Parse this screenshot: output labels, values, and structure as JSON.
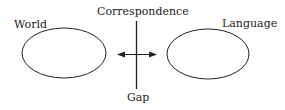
{
  "diagram": {
    "labels": {
      "world": "World",
      "correspondence": "Correspondence",
      "language": "Language",
      "gap": "Gap"
    },
    "nodes": [
      {
        "id": "world",
        "shape": "ellipse"
      },
      {
        "id": "language",
        "shape": "ellipse"
      }
    ],
    "edges": [
      {
        "from": "world",
        "to": "language",
        "type": "bidirectional-arrow"
      }
    ],
    "divider": {
      "orientation": "vertical",
      "top_label": "Correspondence",
      "bottom_label": "Gap"
    },
    "colors": {
      "stroke": "#222222",
      "background": "#ffffff"
    }
  }
}
